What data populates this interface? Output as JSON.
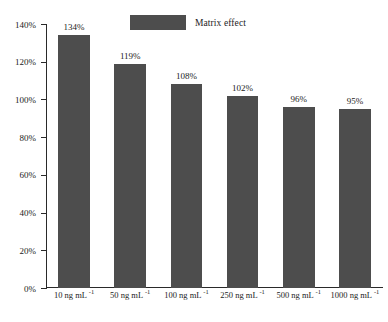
{
  "chart_data": {
    "type": "bar",
    "title": "",
    "xlabel": "",
    "ylabel": "",
    "ylim": [
      0,
      140
    ],
    "grid": false,
    "legend_position": "top-center",
    "categories": [
      "10 ng mL",
      "50 ng mL",
      "100 ng mL",
      "250 ng mL",
      "500 ng mL",
      "1000 ng mL"
    ],
    "category_exponents": [
      "-1",
      "-1",
      "-1",
      "-1",
      "-1",
      "-1"
    ],
    "values": [
      134,
      119,
      108,
      102,
      96,
      95
    ],
    "data_labels": [
      "134%",
      "119%",
      "108%",
      "102%",
      "96%",
      "95%"
    ],
    "ytick_labels": [
      "0%",
      "20%",
      "40%",
      "60%",
      "80%",
      "100%",
      "120%",
      "140%"
    ],
    "ytick_values": [
      0,
      20,
      40,
      60,
      80,
      100,
      120,
      140
    ],
    "series": [
      {
        "name": "Matrix effect",
        "values": [
          134,
          119,
          108,
          102,
          96,
          95
        ],
        "color": "#4d4d4d"
      }
    ]
  },
  "legend": {
    "label": "Matrix effect",
    "swatch_color": "#4d4d4d"
  },
  "colors": {
    "bar": "#4d4d4d",
    "axis": "#2a2a2a",
    "text": "#1c1c1c",
    "background": "#ffffff"
  }
}
